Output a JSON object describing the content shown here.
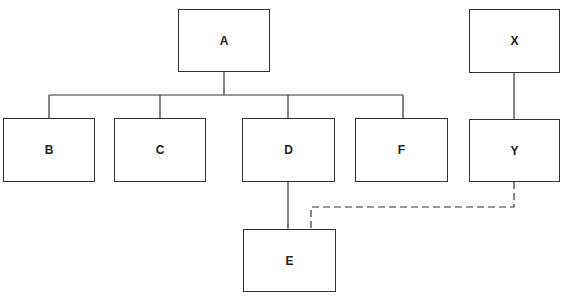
{
  "diagram": {
    "nodes": [
      {
        "id": "A",
        "label": "A"
      },
      {
        "id": "B",
        "label": "B"
      },
      {
        "id": "C",
        "label": "C"
      },
      {
        "id": "D",
        "label": "D"
      },
      {
        "id": "F",
        "label": "F"
      },
      {
        "id": "X",
        "label": "X"
      },
      {
        "id": "Y",
        "label": "Y"
      },
      {
        "id": "E",
        "label": "E"
      }
    ],
    "edges": [
      {
        "from": "A",
        "to": "B",
        "style": "solid"
      },
      {
        "from": "A",
        "to": "C",
        "style": "solid"
      },
      {
        "from": "A",
        "to": "D",
        "style": "solid"
      },
      {
        "from": "A",
        "to": "F",
        "style": "solid"
      },
      {
        "from": "X",
        "to": "Y",
        "style": "solid"
      },
      {
        "from": "D",
        "to": "E",
        "style": "solid"
      },
      {
        "from": "Y",
        "to": "E",
        "style": "dashed"
      }
    ],
    "colors": {
      "line": "#333333",
      "background": "#ffffff"
    }
  }
}
